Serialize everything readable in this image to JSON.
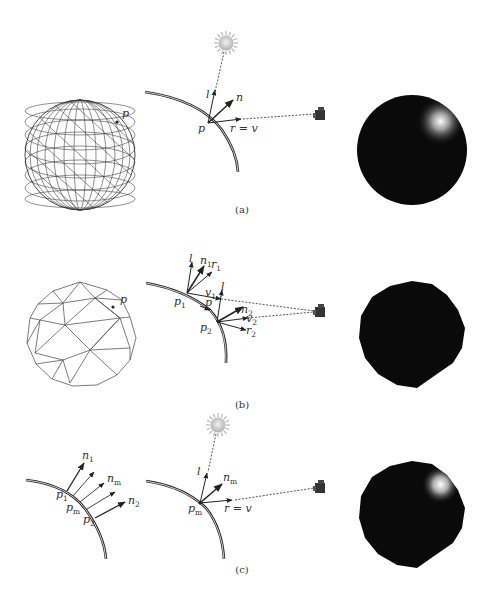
{
  "figure": {
    "panels": [
      {
        "caption": "(a)",
        "mesh_label": "p",
        "vector_labels": {
          "point": "p",
          "light": "l",
          "normal": "n",
          "reflect_view": "r = v"
        }
      },
      {
        "caption": "(b)",
        "mesh_label": "p",
        "vector_labels": {
          "p1": "p",
          "p1_sub": "1",
          "p2": "p",
          "p2_sub": "2",
          "p": "p",
          "l1": "l",
          "l2": "l",
          "n1": "n",
          "n1_sub": "1",
          "n2": "n",
          "n2_sub": "2",
          "r1": "r",
          "r1_sub": "1",
          "r2": "r",
          "r2_sub": "2",
          "v1": "v",
          "v1_sub": "1",
          "v2": "v",
          "v2_sub": "2"
        }
      },
      {
        "caption": "(c)",
        "interp_labels": {
          "n1": "n",
          "n1_sub": "1",
          "nm": "n",
          "nm_sub": "m",
          "n2": "n",
          "n2_sub": "2",
          "p1": "p",
          "p1_sub": "1",
          "pm": "p",
          "pm_sub": "m",
          "p2": "p",
          "p2_sub": "2"
        },
        "vector_labels": {
          "pm": "p",
          "pm_sub": "m",
          "light": "l",
          "nm": "n",
          "nm_sub": "m",
          "reflect_view": "r = v"
        }
      }
    ],
    "icons": [
      "sun-icon",
      "camera-icon",
      "shaded-sphere"
    ],
    "colors": {
      "line": "#222222",
      "sphere": "#0a0a0a",
      "highlight": "#ffffff",
      "sun": "#c8c8c8"
    }
  }
}
